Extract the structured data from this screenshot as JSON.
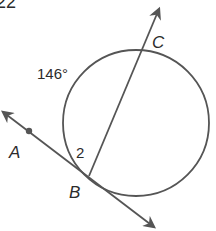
{
  "problem_number_fragment": "22",
  "labels": {
    "arc_measure": "146°",
    "point_c": "C",
    "point_a": "A",
    "point_b": "B",
    "angle_number": "2"
  },
  "colors": {
    "stroke": "#555555",
    "text": "#2b2b2b",
    "background": "#ffffff"
  },
  "geometry": {
    "circle": {
      "cx": 136,
      "cy": 123,
      "r": 73
    },
    "tangent_line": {
      "start": [
        2,
        111
      ],
      "end": [
        155,
        228
      ],
      "through": "A,B"
    },
    "secant_ray": {
      "start": [
        89,
        176
      ],
      "end": [
        160,
        8
      ],
      "through": "B,C"
    },
    "point_a": [
      29,
      131
    ],
    "point_b": [
      89,
      176
    ],
    "point_c": [
      141,
      51
    ]
  }
}
